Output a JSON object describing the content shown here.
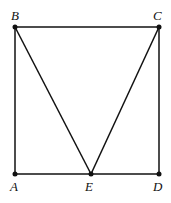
{
  "diagram": {
    "type": "geometry",
    "points": [
      {
        "name": "B",
        "x": 15,
        "y": 27,
        "label_dx": -2,
        "label_dy": -7
      },
      {
        "name": "C",
        "x": 159,
        "y": 27,
        "label_dx": -2,
        "label_dy": -7
      },
      {
        "name": "A",
        "x": 15,
        "y": 174,
        "label_dx": -2,
        "label_dy": 17
      },
      {
        "name": "E",
        "x": 91,
        "y": 174,
        "label_dx": -3,
        "label_dy": 17
      },
      {
        "name": "D",
        "x": 159,
        "y": 174,
        "label_dx": -3,
        "label_dy": 17
      }
    ],
    "segments": [
      [
        "A",
        "B"
      ],
      [
        "B",
        "C"
      ],
      [
        "C",
        "D"
      ],
      [
        "A",
        "D"
      ],
      [
        "B",
        "E"
      ],
      [
        "C",
        "E"
      ]
    ],
    "labels": {
      "A": "A",
      "B": "B",
      "C": "C",
      "D": "D",
      "E": "E"
    }
  }
}
